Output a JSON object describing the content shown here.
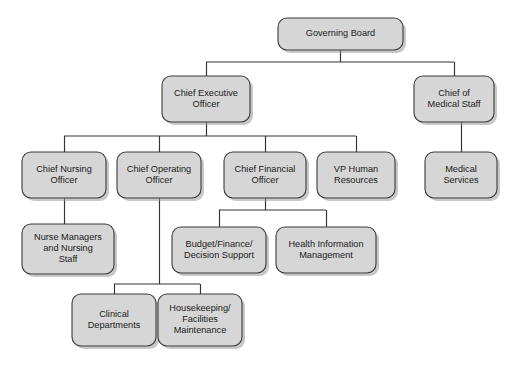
{
  "chart_data": {
    "type": "diagram",
    "diagram_kind": "organizational-chart",
    "orientation": "top-down",
    "style": {
      "node_fill": "#d6d6d6",
      "node_border": "#3a3a3a",
      "connector_color": "#333333",
      "background": "#ffffff",
      "text_color": "#1a1a1a",
      "node_shape": "rounded-rectangle",
      "shadow": true
    },
    "levels": [
      {
        "level": 0,
        "nodes": [
          "governing-board"
        ]
      },
      {
        "level": 1,
        "nodes": [
          "chief-executive-officer",
          "chief-of-medical-staff"
        ]
      },
      {
        "level": 2,
        "nodes": [
          "chief-nursing-officer",
          "chief-operating-officer",
          "chief-financial-officer",
          "vp-human-resources",
          "medical-services"
        ]
      },
      {
        "level": 3,
        "nodes": [
          "nurse-managers-and-nursing-staff",
          "budget-finance-decision-support",
          "health-information-management"
        ]
      },
      {
        "level": 4,
        "nodes": [
          "clinical-departments",
          "housekeeping-facilities-maintenance"
        ]
      }
    ],
    "nodes": [
      {
        "id": "governing-board",
        "label": "Governing Board",
        "lines": [
          "Governing Board"
        ],
        "x": 278,
        "y": 18,
        "w": 125,
        "h": 32,
        "level": 0
      },
      {
        "id": "chief-executive-officer",
        "label": "Chief Executive Officer",
        "lines": [
          "Chief Executive",
          "Officer"
        ],
        "x": 162,
        "y": 76,
        "w": 88,
        "h": 46,
        "level": 1
      },
      {
        "id": "chief-of-medical-staff",
        "label": "Chief of Medical Staff",
        "lines": [
          "Chief of",
          "Medical Staff"
        ],
        "x": 414,
        "y": 76,
        "w": 80,
        "h": 46,
        "level": 1
      },
      {
        "id": "chief-nursing-officer",
        "label": "Chief Nursing Officer",
        "lines": [
          "Chief Nursing",
          "Officer"
        ],
        "x": 22,
        "y": 152,
        "w": 84,
        "h": 46,
        "level": 2
      },
      {
        "id": "chief-operating-officer",
        "label": "Chief Operating Officer",
        "lines": [
          "Chief Operating",
          "Officer"
        ],
        "x": 117,
        "y": 152,
        "w": 84,
        "h": 46,
        "level": 2
      },
      {
        "id": "chief-financial-officer",
        "label": "Chief Financial Officer",
        "lines": [
          "Chief Financial",
          "Officer"
        ],
        "x": 224,
        "y": 152,
        "w": 82,
        "h": 46,
        "level": 2
      },
      {
        "id": "vp-human-resources",
        "label": "VP Human Resources",
        "lines": [
          "VP Human",
          "Resources"
        ],
        "x": 317,
        "y": 152,
        "w": 78,
        "h": 46,
        "level": 2
      },
      {
        "id": "medical-services",
        "label": "Medical Services",
        "lines": [
          "Medical",
          "Services"
        ],
        "x": 425,
        "y": 152,
        "w": 72,
        "h": 46,
        "level": 2
      },
      {
        "id": "nurse-managers-and-nursing-staff",
        "label": "Nurse Managers and Nursing Staff",
        "lines": [
          "Nurse Managers",
          "and Nursing",
          "Staff"
        ],
        "x": 22,
        "y": 224,
        "w": 92,
        "h": 50,
        "level": 3
      },
      {
        "id": "budget-finance-decision-support",
        "label": "Budget/Finance/Decision Support",
        "lines": [
          "Budget/Finance/",
          "Decision Support"
        ],
        "x": 172,
        "y": 227,
        "w": 94,
        "h": 46,
        "level": 3
      },
      {
        "id": "health-information-management",
        "label": "Health Information Management",
        "lines": [
          "Health Information",
          "Management"
        ],
        "x": 276,
        "y": 227,
        "w": 100,
        "h": 46,
        "level": 3
      },
      {
        "id": "clinical-departments",
        "label": "Clinical Departments",
        "lines": [
          "Clinical",
          "Departments"
        ],
        "x": 72,
        "y": 294,
        "w": 84,
        "h": 52,
        "level": 4
      },
      {
        "id": "housekeeping-facilities-maintenance",
        "label": "Housekeeping/Facilities Maintenance",
        "lines": [
          "Housekeeping/",
          "Facilities",
          "Maintenance"
        ],
        "x": 158,
        "y": 294,
        "w": 84,
        "h": 52,
        "level": 4
      }
    ],
    "edges": [
      {
        "from": "governing-board",
        "to": "chief-executive-officer"
      },
      {
        "from": "governing-board",
        "to": "chief-of-medical-staff"
      },
      {
        "from": "chief-executive-officer",
        "to": "chief-nursing-officer"
      },
      {
        "from": "chief-executive-officer",
        "to": "chief-operating-officer"
      },
      {
        "from": "chief-executive-officer",
        "to": "chief-financial-officer"
      },
      {
        "from": "chief-executive-officer",
        "to": "vp-human-resources"
      },
      {
        "from": "chief-of-medical-staff",
        "to": "medical-services"
      },
      {
        "from": "chief-nursing-officer",
        "to": "nurse-managers-and-nursing-staff"
      },
      {
        "from": "chief-financial-officer",
        "to": "budget-finance-decision-support"
      },
      {
        "from": "chief-financial-officer",
        "to": "health-information-management"
      },
      {
        "from": "chief-operating-officer",
        "to": "clinical-departments"
      },
      {
        "from": "chief-operating-officer",
        "to": "housekeeping-facilities-maintenance"
      }
    ],
    "connector_paths": [
      "M340.5,50 L340.5,62",
      "M206,62 L454,62",
      "M206.5,62 L206.5,76",
      "M454.5,62 L454.5,76",
      "M206.5,122 L206.5,136",
      "M64,136 L356,136",
      "M64.5,136 L64.5,152",
      "M159.5,136 L159.5,152",
      "M265.5,136 L265.5,152",
      "M356.5,136 L356.5,152",
      "M461.5,122 L461.5,152",
      "M64.5,198 L64.5,224",
      "M265.5,198 L265.5,210",
      "M219,210 L326,210",
      "M219.5,210 L219.5,227",
      "M326.5,210 L326.5,227",
      "M159.5,198 L159.5,284",
      "M114,284 L200,284",
      "M114.5,284 L114.5,294",
      "M200.5,284 L200.5,294"
    ],
    "caption": ""
  }
}
